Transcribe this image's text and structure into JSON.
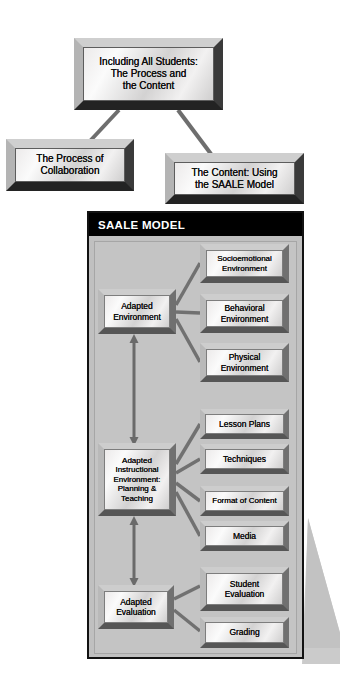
{
  "diagram": {
    "title_box": {
      "label": "Including All Students:\nThe Process and\nthe Content"
    },
    "branch_left": {
      "label": "The Process of\nCollaboration"
    },
    "branch_right": {
      "label": "The Content: Using\nthe SAALE Model"
    },
    "panel": {
      "header": "SAALE MODEL",
      "header_bg": "#000000",
      "header_color": "#ffffff",
      "body_bg": "#c4c4c4",
      "border_color": "#121212"
    },
    "primary_nodes": [
      {
        "id": "adapted-environment",
        "label": "Adapted\nEnvironment"
      },
      {
        "id": "adapted-instructional-environment",
        "label": "Adapted\nInstructional\nEnvironment:\nPlanning &\nTeaching"
      },
      {
        "id": "adapted-evaluation",
        "label": "Adapted\nEvaluation"
      }
    ],
    "environment_children": [
      {
        "id": "socioemotional-environment",
        "label": "Socioemotional\nEnvironment"
      },
      {
        "id": "behavioral-environment",
        "label": "Behavioral\nEnvironment"
      },
      {
        "id": "physical-environment",
        "label": "Physical\nEnvironment"
      }
    ],
    "instructional_children": [
      {
        "id": "lesson-plans",
        "label": "Lesson Plans"
      },
      {
        "id": "techniques",
        "label": "Techniques"
      },
      {
        "id": "format-of-content",
        "label": "Format of Content"
      },
      {
        "id": "media",
        "label": "Media"
      }
    ],
    "evaluation_children": [
      {
        "id": "student-evaluation",
        "label": "Student\nEvaluation"
      },
      {
        "id": "grading",
        "label": "Grading"
      }
    ],
    "colors": {
      "connector": "#6e6e6e",
      "arrow": "#6a6a6a",
      "box_frame": "#8e8e8e",
      "box_face_light": "#fbfbfb",
      "box_face_dark": "#cfcece",
      "page_bg": "#ffffff",
      "shadow": "#c9c9c9"
    }
  }
}
